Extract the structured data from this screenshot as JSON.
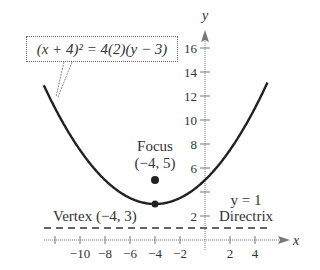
{
  "chart_data": {
    "type": "line",
    "title": "",
    "equation": "(x + 4)^2 = 4(2)(y - 3)",
    "equation_display": "(x + 4)² = 4(2)(y − 3)",
    "xlabel": "x",
    "ylabel": "y",
    "xlim": [
      -13,
      6
    ],
    "ylim": [
      0,
      17
    ],
    "grid": false,
    "x_ticks": [
      -10,
      -8,
      -6,
      -4,
      -2,
      2,
      4
    ],
    "x_tick_labels": [
      "−10",
      "−8",
      "−6",
      "−4",
      "−2",
      "2",
      "4"
    ],
    "y_ticks": [
      2,
      4,
      6,
      8,
      10,
      12,
      14,
      16
    ],
    "y_tick_labels": [
      "2",
      "4",
      "6",
      "8",
      "10",
      "12",
      "14",
      "16"
    ],
    "series": [
      {
        "name": "parabola",
        "x": [
          -12.9,
          -12,
          -10,
          -8,
          -6,
          -4,
          -2,
          0,
          2,
          4,
          5
        ],
        "y": [
          12.9,
          11,
          7.5,
          5,
          3.5,
          3,
          3.5,
          5,
          7.5,
          11,
          13.1
        ]
      },
      {
        "name": "directrix",
        "style": "dashed",
        "x": [
          -13,
          5
        ],
        "y": [
          1,
          1
        ]
      }
    ],
    "points": [
      {
        "name": "Vertex",
        "x": -4,
        "y": 3
      },
      {
        "name": "Focus",
        "x": -4,
        "y": 5
      }
    ],
    "annotations": [
      {
        "text": "Focus",
        "x": -4,
        "y": 7.5
      },
      {
        "text": "(−4, 5)",
        "x": -4,
        "y": 6
      },
      {
        "text": "Vertex (−4, 3)",
        "x": -9,
        "y": 2
      },
      {
        "text": "y = 1",
        "x": 3,
        "y": 3.2
      },
      {
        "text": "Directrix",
        "x": 3,
        "y": 2
      }
    ]
  },
  "labels": {
    "equation": "(x + 4)² = 4(2)(y − 3)",
    "focus_title": "Focus",
    "focus_coords": "(−4, 5)",
    "vertex": "Vertex (−4, 3)",
    "directrix_eq": "y = 1",
    "directrix": "Directrix",
    "x_axis": "x",
    "y_axis": "y"
  }
}
